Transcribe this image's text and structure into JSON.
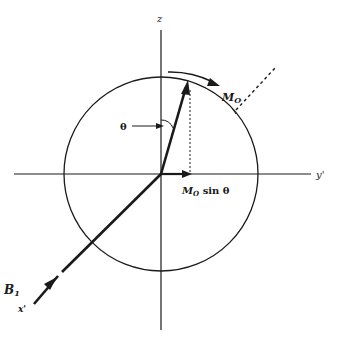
{
  "figure": {
    "type": "vector-diagram",
    "colors": {
      "ink": "#1a1a1a",
      "background": "#ffffff"
    }
  },
  "axes": {
    "z_label": "z",
    "y_label": "y'",
    "x_label": "x'"
  },
  "labels": {
    "theta": "θ",
    "magnetization": "M",
    "magnetization_sub": "O",
    "projection_prefix": "M",
    "projection_sub": "O",
    "projection_suffix": " sin θ",
    "field": "B",
    "field_sub": "1"
  }
}
